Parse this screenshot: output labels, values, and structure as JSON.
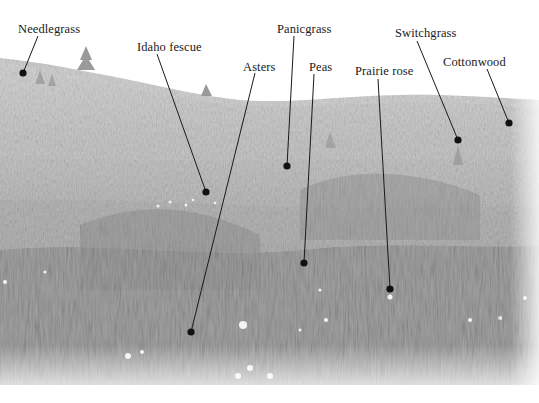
{
  "figure": {
    "palette": {
      "sky": "#ffffff",
      "far_hill": "#cfcfcf",
      "mid_field": "#bdbdbd",
      "near_grass": "#a8a8a8",
      "dark_grass": "#8a8a8a",
      "tree": "#9a9a9a",
      "flower": "#f2f2f2",
      "leader_line": "#1a1a1a",
      "dot": "#111111"
    }
  },
  "labels": [
    {
      "id": "needlegrass",
      "text": "Needlegrass",
      "x": 18,
      "y": 23,
      "line": [
        38,
        36,
        23,
        73
      ]
    },
    {
      "id": "idaho-fescue",
      "text": "Idaho fescue",
      "x": 137,
      "y": 41,
      "line": [
        157,
        54,
        206,
        192
      ]
    },
    {
      "id": "asters",
      "text": "Asters",
      "x": 243,
      "y": 61,
      "line": [
        255,
        73,
        191,
        332
      ]
    },
    {
      "id": "panicgrass",
      "text": "Panicgrass",
      "x": 277,
      "y": 23,
      "line": [
        294,
        36,
        287,
        166
      ]
    },
    {
      "id": "peas",
      "text": "Peas",
      "x": 309,
      "y": 61,
      "line": [
        314,
        74,
        304,
        263
      ]
    },
    {
      "id": "prairie-rose",
      "text": "Prairie rose",
      "x": 355,
      "y": 65,
      "line": [
        378,
        79,
        390,
        289
      ]
    },
    {
      "id": "switchgrass",
      "text": "Switchgrass",
      "x": 395,
      "y": 27,
      "line": [
        417,
        41,
        458,
        140
      ]
    },
    {
      "id": "cottonwood",
      "text": "Cottonwood",
      "x": 443,
      "y": 56,
      "line": [
        487,
        69,
        509,
        123
      ]
    }
  ]
}
